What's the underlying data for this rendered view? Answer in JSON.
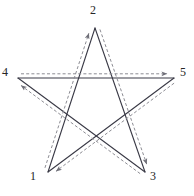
{
  "figure": {
    "width": 194,
    "height": 196,
    "background_color": "#ffffff"
  },
  "style": {
    "solid_stroke_color": "#3a3a46",
    "dashed_stroke_color": "#8c8c93",
    "solid_stroke_width": 1.1,
    "dashed_stroke_width": 1,
    "dash_pattern": "3,2.2",
    "label_color": "#262626",
    "label_font_size": 12
  },
  "vertices": [
    {
      "id": "1",
      "label": "1",
      "x": 48,
      "y": 172,
      "label_x": 30,
      "label_y": 170,
      "role": "bottom-left-point"
    },
    {
      "id": "2",
      "label": "2",
      "x": 95,
      "y": 28,
      "label_x": 90,
      "label_y": 4,
      "role": "top-point"
    },
    {
      "id": "3",
      "label": "3",
      "x": 145,
      "y": 172,
      "label_x": 150,
      "label_y": 170,
      "role": "bottom-right-point"
    },
    {
      "id": "4",
      "label": "4",
      "x": 18,
      "y": 78,
      "label_x": 2,
      "label_y": 66,
      "role": "left-point"
    },
    {
      "id": "5",
      "label": "5",
      "x": 174,
      "y": 78,
      "label_x": 180,
      "label_y": 66,
      "role": "right-point"
    }
  ],
  "solid_edges": [
    {
      "name": "edge-1-2",
      "from": "1",
      "to": "2"
    },
    {
      "name": "edge-2-3",
      "from": "2",
      "to": "3"
    },
    {
      "name": "edge-3-4",
      "from": "3",
      "to": "4"
    },
    {
      "name": "edge-4-5",
      "from": "4",
      "to": "5"
    },
    {
      "name": "edge-5-1",
      "from": "5",
      "to": "1"
    }
  ],
  "dashed_path": {
    "description": "Offset dashed trace showing traversal order with arrowheads",
    "order": [
      "1",
      "2",
      "3",
      "4",
      "5",
      "1"
    ],
    "segments": [
      {
        "name": "arrow-1-to-2",
        "from": "1",
        "to": "2",
        "arrow_at": "2",
        "arrow_direction": "up"
      },
      {
        "name": "arrow-2-to-3",
        "from": "2",
        "to": "3",
        "arrow_at": "3",
        "arrow_direction": "down-right"
      },
      {
        "name": "arrow-3-to-4",
        "from": "3",
        "to": "4",
        "arrow_at": "4",
        "arrow_direction": "left"
      },
      {
        "name": "arrow-4-to-5",
        "from": "4",
        "to": "5",
        "arrow_at": "5",
        "arrow_direction": "right"
      },
      {
        "name": "arrow-5-to-1",
        "from": "5",
        "to": "1",
        "arrow_at": "1",
        "arrow_direction": "left"
      }
    ]
  }
}
